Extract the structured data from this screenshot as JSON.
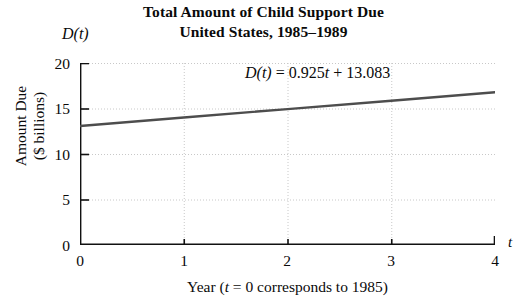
{
  "chart_data": {
    "type": "line",
    "title": "Total Amount of Child Support Due",
    "subtitle": "United States, 1985–1989",
    "xlabel": "Year (t = 0 corresponds to 1985)",
    "ylabel": "Amount Due ($ billions)",
    "x_axis_symbol": "t",
    "y_axis_symbol": "D(t)",
    "xlim": [
      0,
      4
    ],
    "ylim": [
      0,
      20
    ],
    "xticks": [
      "0",
      "1",
      "2",
      "3",
      "4"
    ],
    "xtick_values": [
      0,
      1,
      2,
      3,
      4
    ],
    "yticks": [
      "0",
      "5",
      "10",
      "15",
      "20"
    ],
    "ytick_values": [
      0,
      5,
      10,
      15,
      20
    ],
    "grid": true,
    "legend": "none",
    "annotation": "D(t) = 0.925t + 13.083",
    "equation": {
      "lhs": "D(t)",
      "equals": "=",
      "slope": 0.925,
      "slope_term": "0.925t",
      "plus": "+",
      "intercept": 13.083
    },
    "series": [
      {
        "name": "D(t) = 0.925t + 13.083",
        "color": "#4d4d4d",
        "x": [
          0,
          1,
          2,
          3,
          4
        ],
        "values": [
          13.083,
          14.008,
          14.933,
          15.858,
          16.783
        ]
      }
    ]
  },
  "labels": {
    "title_line1": "Total Amount of Child Support Due",
    "title_line2": "United States, 1985–1989",
    "y_symbol": "D(t)",
    "x_symbol": "t",
    "y_title_line1": "Amount Due",
    "y_title_line2": "($ billions)",
    "x_caption_pre": "Year (",
    "x_caption_var": "t",
    "x_caption_post": " = 0 corresponds to 1985)",
    "equation_lhs": "D(t)",
    "equation_eq": "= 0.925",
    "equation_var": "t",
    "equation_rest": "+ 13.083"
  },
  "colors": {
    "line": "#4d4d4d",
    "axis": "#111111",
    "grid": "#c8c8c8",
    "background": "#ffffff"
  }
}
